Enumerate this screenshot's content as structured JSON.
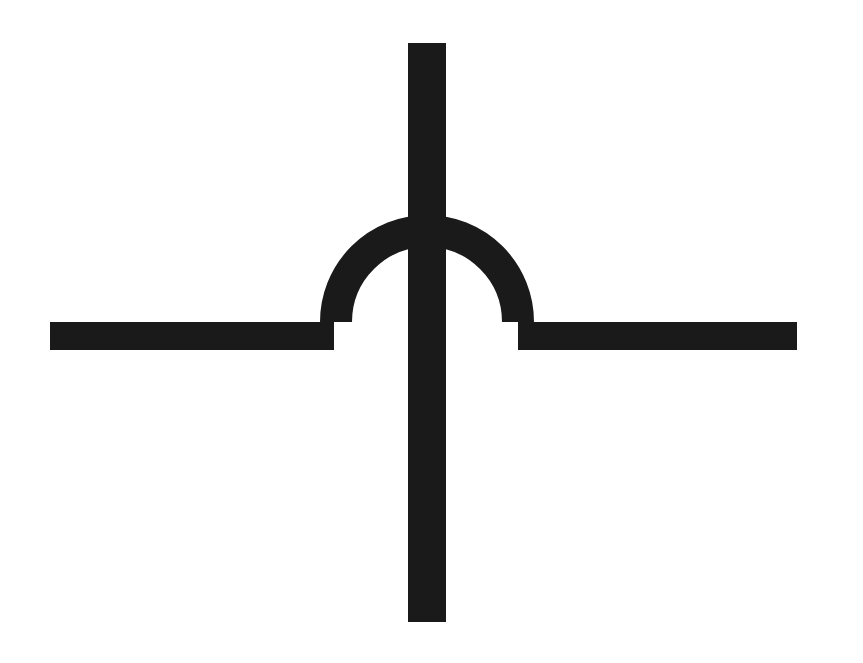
{
  "page": {
    "width": 863,
    "height": 663,
    "background_color": "#ffffff"
  },
  "figure": {
    "name": "wire-crossover-hop-symbol",
    "stroke_color": "#1a1a1a",
    "fill_color": "none",
    "elements": [
      {
        "name": "vertical-wire",
        "type": "line",
        "orientation": "vertical",
        "x": 427,
        "y_start": 43,
        "y_end": 622,
        "thickness": 38
      },
      {
        "name": "horizontal-wire-left-segment",
        "type": "line",
        "orientation": "horizontal",
        "y": 336,
        "x_start": 50,
        "x_end": 334,
        "thickness": 28
      },
      {
        "name": "horizontal-wire-right-segment",
        "type": "line",
        "orientation": "horizontal",
        "y": 336,
        "x_start": 518,
        "x_end": 797,
        "thickness": 28
      },
      {
        "name": "hop-arc",
        "type": "semicircle-arc",
        "center_x": 427,
        "center_y": 322,
        "radius": 91,
        "thickness": 32,
        "opening": "down",
        "sweep_degrees": 180
      }
    ]
  },
  "chart_data": {
    "type": "diagram",
    "subtitle": "",
    "xlabel": "",
    "ylabel": "",
    "legend": [],
    "annotations": [],
    "shapes": [
      {
        "id": "vertical-wire",
        "kind": "rect",
        "x": 408,
        "y": 43,
        "width": 38,
        "height": 579,
        "color": "#1a1a1a"
      },
      {
        "id": "horizontal-wire-left-segment",
        "kind": "rect",
        "x": 50,
        "y": 322,
        "width": 284,
        "height": 28,
        "color": "#1a1a1a"
      },
      {
        "id": "horizontal-wire-right-segment",
        "kind": "rect",
        "x": 518,
        "y": 322,
        "width": 279,
        "height": 28,
        "color": "#1a1a1a"
      },
      {
        "id": "hop-arc",
        "kind": "arc",
        "cx": 427,
        "cy": 322,
        "r": 91,
        "stroke_width": 32,
        "start_angle": 180,
        "end_angle": 360,
        "color": "#1a1a1a"
      }
    ],
    "bbox": {
      "x_min": 50,
      "y_min": 43,
      "x_max": 797,
      "y_max": 622
    }
  }
}
